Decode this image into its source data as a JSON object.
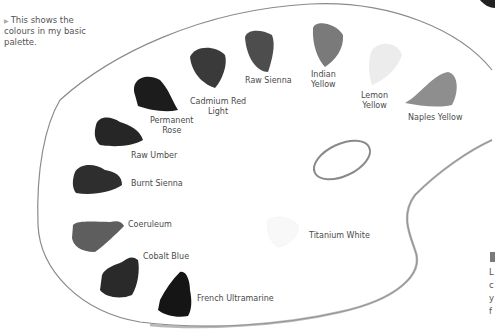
{
  "caption": {
    "marker": "▶",
    "text": "This shows the colours in my basic palette."
  },
  "palette": {
    "outline_color": "#8a8a8a",
    "thumb_hole": true,
    "colours": [
      {
        "name": "Permanent Rose",
        "label_lines": [
          "Permanent",
          "Rose"
        ],
        "swatch": "#1c1c1c"
      },
      {
        "name": "Cadmium Red Light",
        "label_lines": [
          "Cadmium Red",
          "Light"
        ],
        "swatch": "#3a3a3a"
      },
      {
        "name": "Raw Sienna",
        "label_lines": [
          "Raw Sienna"
        ],
        "swatch": "#4a4a4a"
      },
      {
        "name": "Indian Yellow",
        "label_lines": [
          "Indian",
          "Yellow"
        ],
        "swatch": "#7a7a7a"
      },
      {
        "name": "Lemon Yellow",
        "label_lines": [
          "Lemon",
          "Yellow"
        ],
        "swatch": "#e2e2e2"
      },
      {
        "name": "Naples Yellow",
        "label_lines": [
          "Naples Yellow"
        ],
        "swatch": "#8e8e8e"
      },
      {
        "name": "Raw Umber",
        "label_lines": [
          "Raw Umber"
        ],
        "swatch": "#262626"
      },
      {
        "name": "Burnt Sienna",
        "label_lines": [
          "Burnt Sienna"
        ],
        "swatch": "#2e2e2e"
      },
      {
        "name": "Coeruleum",
        "label_lines": [
          "Coeruleum"
        ],
        "swatch": "#5e5e5e"
      },
      {
        "name": "Cobalt Blue",
        "label_lines": [
          "Cobalt Blue"
        ],
        "swatch": "#2a2a2a"
      },
      {
        "name": "French Ultramarine",
        "label_lines": [
          "French Ultramarine"
        ],
        "swatch": "#151515"
      },
      {
        "name": "Titanium White",
        "label_lines": [
          "Titanium White"
        ],
        "swatch": "#f6f6f6"
      }
    ]
  },
  "side_panel": {
    "box_color": "#7a7a7a",
    "letters": [
      "L",
      "c",
      "y",
      "f"
    ]
  }
}
